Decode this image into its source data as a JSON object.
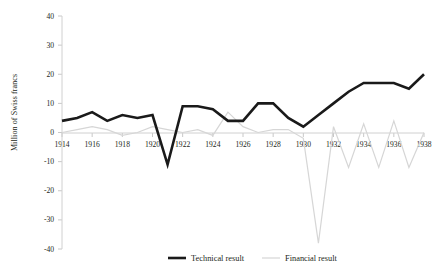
{
  "chart_data": {
    "type": "line",
    "title": "",
    "xlabel": "",
    "ylabel": "Million of Swiss francs",
    "ylim": [
      -40,
      40
    ],
    "xlim": [
      1914,
      1938
    ],
    "ytick_labels": [
      "40",
      "30",
      "20",
      "10",
      "0",
      "-10",
      "-20",
      "-30",
      "-40"
    ],
    "ytick_values": [
      40,
      30,
      20,
      10,
      0,
      -10,
      -20,
      -30,
      -40
    ],
    "xtick_labels": [
      "1914",
      "1916",
      "1918",
      "1920",
      "1922",
      "1924",
      "1926",
      "1928",
      "1930",
      "1932",
      "1934",
      "1936",
      "1938"
    ],
    "xtick_values": [
      1914,
      1916,
      1918,
      1920,
      1922,
      1924,
      1926,
      1928,
      1930,
      1932,
      1934,
      1936,
      1938
    ],
    "grid": false,
    "legend_position": "bottom",
    "x": [
      1914,
      1915,
      1916,
      1917,
      1918,
      1919,
      1920,
      1921,
      1922,
      1923,
      1924,
      1925,
      1926,
      1927,
      1928,
      1929,
      1930,
      1931,
      1932,
      1933,
      1934,
      1935,
      1936,
      1937,
      1938
    ],
    "series": [
      {
        "name": "Technical result",
        "color": "#1a1a1a",
        "width": 2.6,
        "values": [
          4,
          5,
          7,
          4,
          6,
          5,
          6,
          -11,
          9,
          9,
          8,
          4,
          4,
          10,
          10,
          5,
          2,
          6,
          10,
          14,
          17,
          17,
          17,
          15,
          20
        ]
      },
      {
        "name": "Financial result",
        "color": "#d6d6d6",
        "width": 1.2,
        "values": [
          0,
          1,
          2,
          1,
          -1,
          0,
          2,
          1,
          0,
          1,
          -1,
          7,
          2,
          0,
          1,
          1,
          -2,
          -38,
          2,
          -12,
          3,
          -12,
          4,
          -12,
          0
        ]
      }
    ]
  },
  "legend": {
    "items": [
      {
        "label": "Technical result"
      },
      {
        "label": "Financial result"
      }
    ]
  }
}
